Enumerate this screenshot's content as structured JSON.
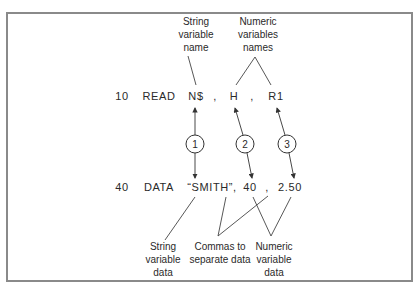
{
  "figure": {
    "top_labels": {
      "string_name": [
        "String",
        "variable",
        "name"
      ],
      "numeric_names": [
        "Numeric",
        "variables",
        "names"
      ]
    },
    "read_statement": {
      "line_number": "10",
      "keyword": "READ",
      "variables": [
        "N$",
        "H",
        "R1"
      ],
      "separator": ","
    },
    "data_statement": {
      "line_number": "40",
      "keyword": "DATA",
      "values": [
        "“SMITH”,",
        "40",
        "2.50"
      ],
      "separator": ","
    },
    "circles": [
      "1",
      "2",
      "3"
    ],
    "bottom_labels": {
      "string_data": [
        "String",
        "variable",
        "data"
      ],
      "commas": [
        "Commas to",
        "separate data"
      ],
      "numeric_data": [
        "Numeric",
        "variable",
        "data"
      ]
    }
  }
}
